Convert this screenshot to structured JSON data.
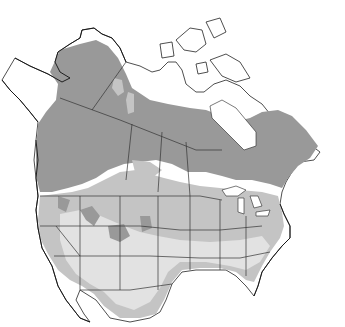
{
  "map": {
    "region": "North America",
    "type": "species range map",
    "legend_colors": {
      "breeding": "#999999",
      "year_round": "#c4c4c4",
      "winter": "#e2e2e2",
      "outside_range": "#ffffff"
    },
    "labels": []
  }
}
